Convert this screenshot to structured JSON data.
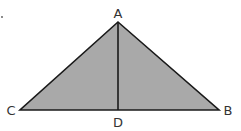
{
  "diagram": {
    "type": "geometry-triangle",
    "fill_color": "#a9a9a9",
    "stroke_color": "#1a1a1a",
    "points": {
      "A": {
        "label": "A",
        "x": 118,
        "y": 22
      },
      "B": {
        "label": "B",
        "x": 219,
        "y": 110
      },
      "C": {
        "label": "C",
        "x": 20,
        "y": 110
      },
      "D": {
        "label": "D",
        "x": 118,
        "y": 110
      }
    },
    "segments": [
      "AB",
      "AC",
      "CB",
      "AD"
    ],
    "labels": {
      "A": "A",
      "B": "B",
      "C": "C",
      "D": "D"
    }
  }
}
